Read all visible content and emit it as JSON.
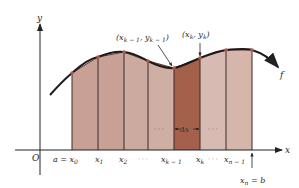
{
  "diagram": {
    "type": "riemann-sum-trapezoid-partition",
    "axes": {
      "x_label": "x",
      "y_label": "y",
      "origin_label": "O"
    },
    "function_label": "f",
    "points_labels": {
      "left": "(x",
      "left_sub": "k − 1",
      "left_mid": ", y",
      "left_sub2": "k − 1",
      "left_close": ")",
      "right": "(x",
      "right_sub": "k",
      "right_mid": ", y",
      "right_sub2": "k",
      "right_close": ")"
    },
    "delta_label": "Δx",
    "tick_labels": [
      {
        "main": "a = x",
        "sub": "0"
      },
      {
        "main": "x",
        "sub": "1"
      },
      {
        "main": "x",
        "sub": "2"
      },
      {
        "main": "· · ·",
        "sub": ""
      },
      {
        "main": "x",
        "sub": "k − 1"
      },
      {
        "main": "x",
        "sub": "k"
      },
      {
        "main": "· · ·",
        "sub": ""
      },
      {
        "main": "x",
        "sub": "n − 1"
      }
    ],
    "end_label": {
      "main": "x",
      "sub": "n",
      "tail": " = b"
    },
    "ellipsis_inside": "· · ·",
    "colors": {
      "strip_fill": "#c9a096",
      "highlight_fill": "#a4604a",
      "curve": "#1e1a18",
      "divider": "#3a2a26",
      "vertex": "#b0584a",
      "axis": "#222222"
    }
  }
}
